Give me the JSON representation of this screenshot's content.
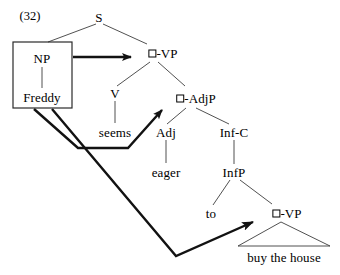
{
  "figure": {
    "example_number": "(32)",
    "sentence_gloss": "Freddy seems eager to buy the house"
  },
  "nodes": {
    "s": "S",
    "np": "NP",
    "freddy": "Freddy",
    "vp_top": "-VP",
    "v": "V",
    "seems": "seems",
    "adjp": "-AdjP",
    "adj": "Adj",
    "eager": "eager",
    "inf_c": "Inf-C",
    "infp": "InfP",
    "to": "to",
    "vp_bottom": "-VP",
    "buy_the_house": "buy the house"
  },
  "icons": {
    "trace_box": "empty-square-trace",
    "movement_arrow": "arrowhead"
  },
  "colors": {
    "ink": "#1a1a1a",
    "thin_line": "#3d3d3d",
    "background": "#ffffff"
  }
}
